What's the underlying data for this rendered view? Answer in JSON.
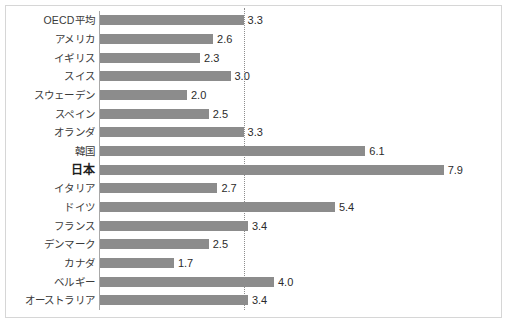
{
  "figure": {
    "width_px": 509,
    "height_px": 332,
    "border_color": "#d6d6d6",
    "background_color": "#ffffff"
  },
  "style": {
    "bar_color": "#8c8c8c",
    "axis_color": "#a8a8a8",
    "reference_line_color": "#8d8d8d",
    "label_color": "#3a3a3a",
    "value_color": "#2b2b2b",
    "highlight_label_color": "#1d1d1d"
  },
  "chart_data": {
    "type": "bar",
    "orientation": "horizontal",
    "title": "",
    "subtitle": "",
    "xlabel": "",
    "ylabel": "",
    "xlim": [
      0,
      9
    ],
    "grid": false,
    "legend": null,
    "value_format": "0.0",
    "value_labels_shown": true,
    "categories": [
      "OECD平均",
      "アメリカ",
      "イギリス",
      "スイス",
      "スウェーデン",
      "スペイン",
      "オランダ",
      "韓国",
      "日本",
      "イタリア",
      "ドイツ",
      "フランス",
      "デンマーク",
      "カナダ",
      "ベルギー",
      "オーストラリア"
    ],
    "values": [
      3.3,
      2.6,
      2.3,
      3.0,
      2.0,
      2.5,
      3.3,
      6.1,
      7.9,
      2.7,
      5.4,
      3.4,
      2.5,
      1.7,
      4.0,
      3.4
    ],
    "value_labels": [
      "3.3",
      "2.6",
      "2.3",
      "3.0",
      "2.0",
      "2.5",
      "3.3",
      "6.1",
      "7.9",
      "2.7",
      "5.4",
      "3.4",
      "2.5",
      "1.7",
      "4.0",
      "3.4"
    ],
    "highlighted_categories": [
      "日本"
    ],
    "annotations": [
      {
        "type": "vertical-reference-line",
        "style": "dotted",
        "value": 3.3,
        "label": ""
      }
    ]
  }
}
